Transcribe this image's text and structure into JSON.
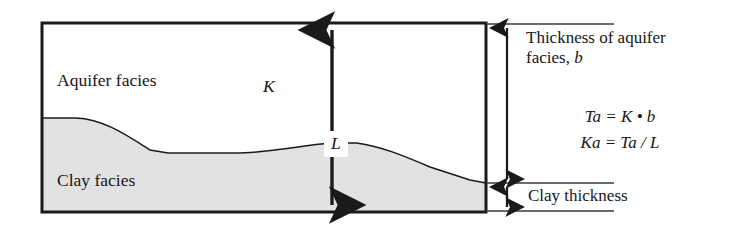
{
  "figure": {
    "type": "geologic-cross-section",
    "box": {
      "aquifer_label": "Aquifer facies",
      "clay_label": "Clay facies",
      "hydraulic_conductivity_symbol": "K",
      "vertical_dimension_symbol": "L"
    },
    "annotations": {
      "aquifer_thickness_line1": "Thickness of aquifer",
      "aquifer_thickness_line2_prefix": "facies, ",
      "aquifer_thickness_symbol": "b",
      "clay_thickness": "Clay thickness"
    },
    "equations": [
      "Ta = K • b",
      "Ka = Ta / L"
    ],
    "colors": {
      "clay_fill": "#e2e2e2",
      "outline": "#1a1a1a",
      "text": "#16161a",
      "background": "#ffffff"
    }
  }
}
